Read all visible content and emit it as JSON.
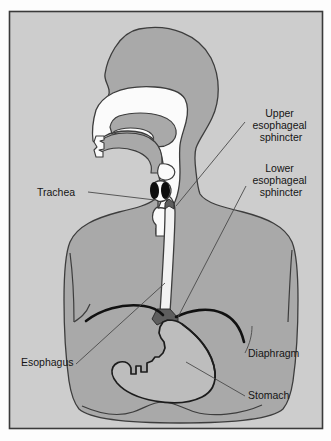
{
  "figure": {
    "type": "anatomical-diagram",
    "frame": {
      "background_color": "#fdfdfd",
      "panel_color": "#cdcdcd",
      "border_color": "#3a3a3a"
    },
    "colors": {
      "body_fill": "#a9a9a9",
      "body_outline": "#3d3d3d",
      "airway_fill": "#fbfbfb",
      "esophagus_fill": "#f2f2f2",
      "stomach_fill": "#bdbdbd",
      "diaphragm_line": "#111111",
      "sphincter_fill": "#5e5e5e",
      "vocal_cord_fill": "#0e0e0e",
      "leader_line": "#4a4a4a",
      "text_color": "#151515"
    }
  },
  "labels": [
    {
      "id": "upper-esophageal-sphincter",
      "lines": [
        "Upper",
        "esophageal",
        "sphincter"
      ],
      "align": "middle",
      "x": 281,
      "y": 117,
      "line_height": 12
    },
    {
      "id": "lower-esophageal-sphincter",
      "lines": [
        "Lower",
        "esophageal",
        "sphincter"
      ],
      "align": "middle",
      "x": 281,
      "y": 172,
      "line_height": 12
    },
    {
      "id": "trachea",
      "lines": [
        "Trachea"
      ],
      "align": "start",
      "x": 37,
      "y": 196,
      "line_height": 12
    },
    {
      "id": "esophagus",
      "lines": [
        "Esophagus"
      ],
      "align": "start",
      "x": 21,
      "y": 366,
      "line_height": 12
    },
    {
      "id": "diaphragm",
      "lines": [
        "Diaphragm"
      ],
      "align": "start",
      "x": 248,
      "y": 357,
      "line_height": 12
    },
    {
      "id": "stomach",
      "lines": [
        "Stomach"
      ],
      "align": "start",
      "x": 248,
      "y": 399,
      "line_height": 12
    }
  ],
  "structures": [
    {
      "id": "head-and-torso",
      "name": "Head and torso silhouette"
    },
    {
      "id": "nasal-cavity",
      "name": "Nasal cavity"
    },
    {
      "id": "oral-cavity",
      "name": "Oral cavity"
    },
    {
      "id": "tongue",
      "name": "Tongue"
    },
    {
      "id": "soft-palate",
      "name": "Soft palate"
    },
    {
      "id": "pharynx",
      "name": "Pharynx"
    },
    {
      "id": "larynx",
      "name": "Larynx"
    },
    {
      "id": "vocal-cords",
      "name": "Vocal cords"
    },
    {
      "id": "trachea-tube",
      "name": "Trachea"
    },
    {
      "id": "esophagus-tube",
      "name": "Esophagus"
    },
    {
      "id": "upper-esophageal-sphincter-marker",
      "name": "Upper esophageal sphincter"
    },
    {
      "id": "lower-esophageal-sphincter-marker",
      "name": "Lower esophageal sphincter"
    },
    {
      "id": "diaphragm-arc",
      "name": "Diaphragm"
    },
    {
      "id": "stomach-body",
      "name": "Stomach"
    }
  ]
}
